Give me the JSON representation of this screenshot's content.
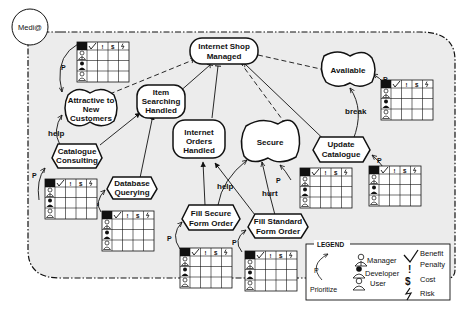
{
  "actor": {
    "label": "Medi@"
  },
  "goals": [
    {
      "id": "internet-shop-managed",
      "label": [
        "Internet Shop",
        "Managed"
      ],
      "type": "hardgoal"
    },
    {
      "id": "item-searching-handled",
      "label": [
        "Item",
        "Searching",
        "Handled"
      ],
      "type": "hardgoal"
    },
    {
      "id": "internet-orders-handled",
      "label": [
        "Internet",
        "Orders",
        "Handled"
      ],
      "type": "hardgoal"
    }
  ],
  "softgoals": [
    {
      "id": "attractive-to-new-customers",
      "label": [
        "Attractive to",
        "New",
        "Customers"
      ]
    },
    {
      "id": "secure",
      "label": [
        "Secure"
      ]
    },
    {
      "id": "available",
      "label": [
        "Avaliable"
      ]
    }
  ],
  "tasks": [
    {
      "id": "catalogue-consulting",
      "label": [
        "Catalogue",
        "Consulting"
      ]
    },
    {
      "id": "database-querying",
      "label": [
        "Database",
        "Querying"
      ]
    },
    {
      "id": "fill-secure-form-order",
      "label": [
        "Fill Secure",
        "Form Order"
      ]
    },
    {
      "id": "fill-standard-form-order",
      "label": [
        "Fill Standard",
        "Form Order"
      ]
    },
    {
      "id": "update-catalogue",
      "label": [
        "Update",
        "Catalogue"
      ]
    }
  ],
  "links": {
    "help": "help",
    "hurt": "hurt",
    "break": "break",
    "prioritize": "P"
  },
  "matrix": {
    "columns": [
      "✓",
      "!",
      "$",
      "ϟ"
    ]
  },
  "legend": {
    "title": "LEGEND",
    "prioritize": "Prioritize",
    "p": "P",
    "manager": "Manager",
    "developer": "Developer",
    "user": "User",
    "benefit": "Benefit",
    "penalty": "Penalty",
    "cost": "Cost",
    "risk": "Risk"
  },
  "colors": {
    "boundary_fill": "#ececec",
    "stroke": "#111111",
    "node_fill": "#ffffff"
  }
}
